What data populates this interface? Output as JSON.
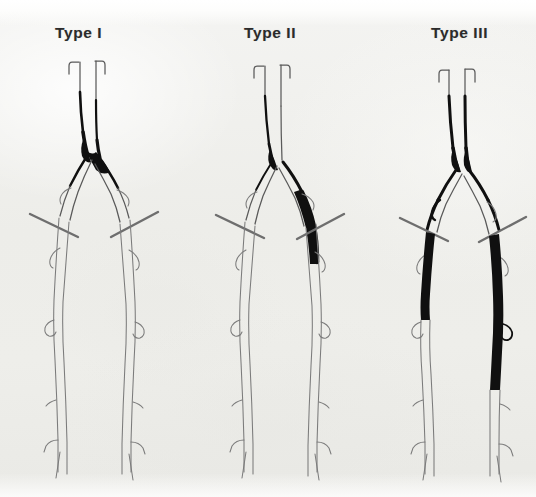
{
  "figure": {
    "background_color": "#efefed",
    "ink_color": "#5a5a5a",
    "occlusion_color": "#101010",
    "width": 536,
    "height": 497
  },
  "panels": [
    {
      "label": "Type I",
      "label_x": 55,
      "center_x": 95,
      "disease_description": "Occlusive disease confined to the distal abdominal aorta and both common iliac arteries",
      "occluded_segments": [
        "distal aorta",
        "aortic bifurcation",
        "right common iliac artery",
        "left common iliac artery"
      ],
      "patent_segments": [
        "external iliac arteries",
        "common femoral arteries",
        "superficial femoral arteries",
        "popliteal arteries",
        "tibial arteries"
      ],
      "inguinal_ligament_markers": 2
    },
    {
      "label": "Type II",
      "label_x": 244,
      "center_x": 278,
      "disease_description": "Disease extends from the distal aorta into the external iliac and common femoral arteries",
      "occluded_segments": [
        "distal aorta",
        "aortic bifurcation",
        "left common iliac artery",
        "left external iliac artery",
        "left common femoral artery"
      ],
      "patent_segments": [
        "right external iliac artery",
        "superficial femoral arteries",
        "popliteal arteries",
        "tibial arteries"
      ],
      "inguinal_ligament_markers": 2
    },
    {
      "label": "Type III",
      "label_x": 431,
      "center_x": 460,
      "disease_description": "Multilevel disease: aortoiliac occlusion combined with bilateral infrainguinal femoral occlusions",
      "occluded_segments": [
        "distal aorta",
        "aortic bifurcation",
        "both common iliac arteries",
        "both external iliac arteries",
        "right superficial femoral artery",
        "left superficial femoral artery"
      ],
      "patent_segments": [
        "distal popliteal arteries",
        "tibial arteries"
      ],
      "inguinal_ligament_markers": 2
    }
  ],
  "anatomy_legend": {
    "renal_stub": "renal-artery-stub",
    "aorta": "abdominal-aorta",
    "bifurcation": "aortic-bifurcation",
    "common_iliac": "common-iliac-artery",
    "internal_iliac": "internal-iliac-artery",
    "external_iliac": "external-iliac-artery",
    "inguinal_ligament": "inguinal-ligament-marker",
    "profunda": "profunda-femoris-artery",
    "superficial_femoral": "superficial-femoral-artery",
    "popliteal": "popliteal-artery",
    "geniculate": "geniculate-branch",
    "tibial_trunk": "tibioperoneal-trunk"
  }
}
